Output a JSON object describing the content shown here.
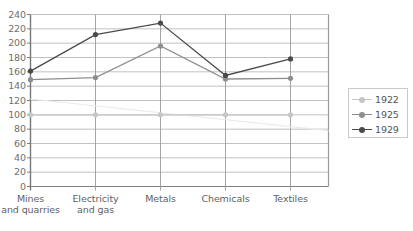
{
  "chart_data": {
    "type": "line",
    "title": "",
    "subtitle": "",
    "xlabel": "",
    "ylabel": "",
    "ylim": [
      0,
      240
    ],
    "ytick_step": 20,
    "yticks": [
      0,
      20,
      40,
      60,
      80,
      100,
      120,
      140,
      160,
      180,
      200,
      220,
      240
    ],
    "grid": true,
    "legend_position": "right",
    "categories": [
      "Mines\nand quarries",
      "Electricity\nand gas",
      "Metals",
      "Chemicals",
      "Textiles"
    ],
    "categories_flat": [
      "Mines and quarries",
      "Electricity and gas",
      "Metals",
      "Chemicals",
      "Textiles"
    ],
    "series": [
      {
        "name": "1922",
        "color": "#c6c6c6",
        "values": [
          100,
          100,
          100,
          100,
          100
        ]
      },
      {
        "name": "1925",
        "color": "#8e8e8e",
        "values": [
          149,
          152,
          196,
          150,
          151
        ]
      },
      {
        "name": "1929",
        "color": "#4a4a4a",
        "values": [
          161,
          212,
          228,
          155,
          178
        ]
      }
    ],
    "annotations": [
      {
        "name": "trend-line",
        "color": "#ebebeb",
        "from": [
          0,
          122
        ],
        "to": [
          5,
          78
        ]
      }
    ]
  },
  "legend": {
    "entries": [
      {
        "label": "1922"
      },
      {
        "label": "1925"
      },
      {
        "label": "1929"
      }
    ]
  }
}
